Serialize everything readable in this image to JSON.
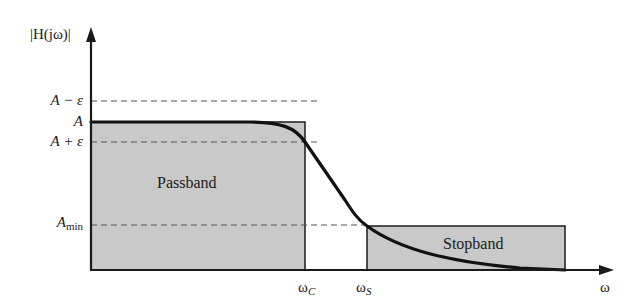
{
  "figure": {
    "y_axis_label": "|H(jω)|",
    "x_axis_label": "ω",
    "y_ticks": [
      {
        "id": "a_minus_eps",
        "label": "A − ε"
      },
      {
        "id": "a",
        "label": "A"
      },
      {
        "id": "a_plus_eps",
        "label": "A + ε"
      },
      {
        "id": "a_min",
        "label_main": "A",
        "label_sub": "min"
      }
    ],
    "x_ticks": [
      {
        "id": "omega_c",
        "label_main": "ω",
        "label_sub": "C"
      },
      {
        "id": "omega_s",
        "label_main": "ω",
        "label_sub": "S"
      }
    ],
    "regions": {
      "passband": "Passband",
      "stopband": "Stopband"
    },
    "colors": {
      "region_fill": "#c9c9c9",
      "curve": "#111111",
      "axis": "#1a1a1a",
      "dashed": "#555555"
    }
  }
}
